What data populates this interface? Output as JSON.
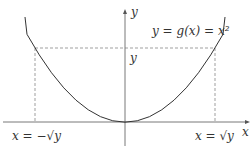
{
  "diagram": {
    "function_label": "y = g(x) = x²",
    "axis_x_label": "x",
    "axis_y_label": "y",
    "y_level_label": "y",
    "left_root_label": "x = −√y",
    "right_root_label": "x = √y",
    "colors": {
      "curve": "#333333",
      "axes": "#555555",
      "dashed": "#777777"
    }
  }
}
